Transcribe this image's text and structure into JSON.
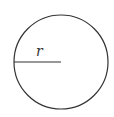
{
  "diagram": {
    "shape": "circle",
    "center": [
      61,
      62
    ],
    "radius": 47,
    "radius_label": "r",
    "stroke_color": "#333333",
    "background": "#ffffff"
  }
}
